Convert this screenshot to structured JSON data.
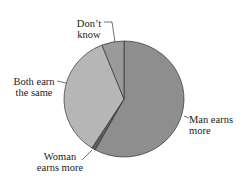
{
  "chart_data": {
    "type": "pie",
    "title": "",
    "categories": [
      "Man earns more",
      "Woman earns more",
      "Both earn the same",
      "Don't know"
    ],
    "values": [
      58,
      1,
      35,
      6
    ],
    "unit": "%",
    "start_angle": "12 o'clock, clockwise",
    "colors": [
      "#8e8e8e",
      "#5e5e5e",
      "#b6b6b6",
      "#9a9a9a"
    ],
    "labels": [
      {
        "line1": "Man earns",
        "line2": "more"
      },
      {
        "line1": "Woman",
        "line2": "earns more"
      },
      {
        "line1": "Both earn",
        "line2": "the same"
      },
      {
        "line1": "Don’t",
        "line2": "know"
      }
    ]
  }
}
